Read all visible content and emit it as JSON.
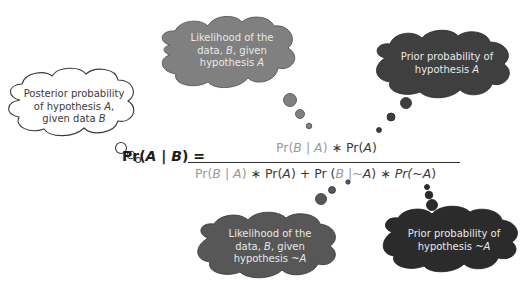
{
  "colors": {
    "posterior_cloud_fill": "#ffffff",
    "posterior_cloud_stroke": "#3a3a3a",
    "likelihood_a_cloud": "#808080",
    "prior_a_cloud": "#3f3f3f",
    "likelihood_not_a_cloud": "#5a5a5a",
    "prior_not_a_cloud": "#2b2b2b",
    "likelihood_term_text": "#9a9a9a",
    "prior_term_text": "#3a3a3a"
  },
  "clouds": {
    "posterior": {
      "line1": "Posterior probability",
      "line2a": "of hypothesis ",
      "line2b": "A",
      "line2c": ",",
      "line3a": "given data ",
      "line3b": "B"
    },
    "likelihood_a": {
      "line1": "Likelihood of the",
      "line2a": "data, ",
      "line2b": "B",
      "line2c": ", given",
      "line3a": "hypothesis ",
      "line3b": "A"
    },
    "prior_a": {
      "line1": "Prior probability of",
      "line2a": "hypothesis ",
      "line2b": "A"
    },
    "likelihood_not_a": {
      "line1": "Likelihood of the",
      "line2a": "data, ",
      "line2b": "B",
      "line2c": ", given",
      "line3a": "hypothesis ",
      "line3b": "~A"
    },
    "prior_not_a": {
      "line1": "Prior probability of",
      "line2a": "hypothesis ",
      "line2b": "~A"
    }
  },
  "formula": {
    "lhs": {
      "pr": "Pr(",
      "a": "A",
      "bar": " | ",
      "b": "B",
      "close": ") ="
    },
    "numerator": {
      "likelihood": {
        "pr": "Pr(",
        "b": "B",
        "bar": " | ",
        "a": "A",
        "close": ")"
      },
      "times": " ∗ ",
      "prior": {
        "pr": "Pr(",
        "a": "A",
        "close": ")"
      }
    },
    "denominator": {
      "t1": {
        "pr": "Pr(",
        "b": "B",
        "bar": " | ",
        "a": "A",
        "close": ")"
      },
      "times1": " ∗ ",
      "t2": {
        "pr": "Pr(",
        "a": "A",
        "close": ")"
      },
      "plus": " + ",
      "t3": {
        "pr": "Pr (",
        "b": "B",
        "bar": " |~",
        "a": "A",
        "close": ")"
      },
      "times2": " ∗ ",
      "t4": {
        "pr": "Pr(~",
        "a": "A",
        "close": ")"
      }
    }
  }
}
